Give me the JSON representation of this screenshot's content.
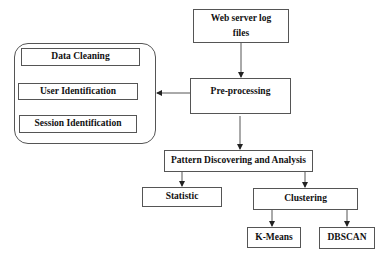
{
  "diagram": {
    "type": "flowchart",
    "nodes": {
      "web_server_logs": "Web server log files",
      "web_server_logs_line1": "Web server log",
      "web_server_logs_line2": "files",
      "preprocessing": "Pre-processing",
      "data_cleaning": "Data Cleaning",
      "user_identification": "User Identification",
      "session_identification": "Session Identification",
      "pattern_discovery": "Pattern Discovering and Analysis",
      "statistic": "Statistic",
      "clustering": "Clustering",
      "kmeans": "K-Means",
      "dbscan": "DBSCAN"
    },
    "edges": [
      {
        "from": "Web server log files",
        "to": "Pre-processing"
      },
      {
        "from": "Pre-processing",
        "to": "Preprocessing steps group"
      },
      {
        "from": "Data Cleaning",
        "to": "User Identification"
      },
      {
        "from": "User Identification",
        "to": "Session Identification"
      },
      {
        "from": "Pre-processing",
        "to": "Pattern Discovering and Analysis"
      },
      {
        "from": "Pattern Discovering and Analysis",
        "to": "Statistic"
      },
      {
        "from": "Pattern Discovering and Analysis",
        "to": "Clustering"
      },
      {
        "from": "Clustering",
        "to": "K-Means"
      },
      {
        "from": "Clustering",
        "to": "DBSCAN"
      }
    ],
    "colors": {
      "stroke": "#555555",
      "text": "#111111",
      "background": "#ffffff"
    }
  }
}
